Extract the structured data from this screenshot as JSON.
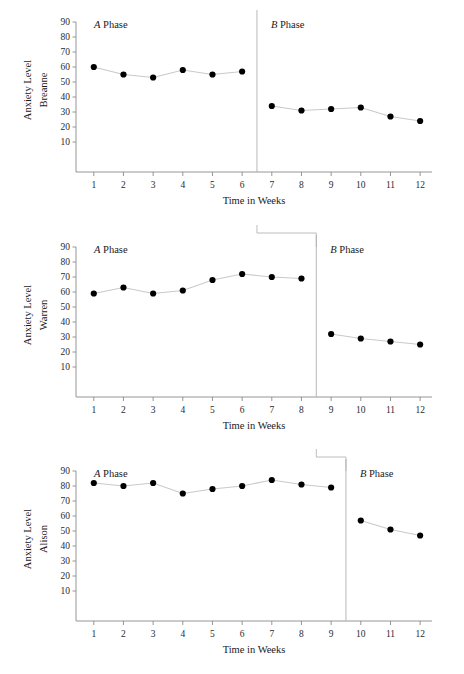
{
  "figure": {
    "type": "multiple-baseline-ab-design",
    "x_axis_title": "Time in Weeks",
    "y_axis_title": "Anxiety Level",
    "phase_a_letter": "A",
    "phase_a_word": "Phase",
    "phase_b_letter": "B",
    "phase_b_word": "Phase",
    "y_ticks": [
      90,
      80,
      70,
      60,
      50,
      40,
      30,
      20,
      10
    ],
    "x_ticks": [
      1,
      2,
      3,
      4,
      5,
      6,
      7,
      8,
      9,
      10,
      11,
      12
    ],
    "colors": {
      "marker": "#000000",
      "series_line": "#c9c9c9",
      "axis": "#8a8a8a",
      "phase_line": "#b0b0b0",
      "connector": "#b5b5b5",
      "background": "#ffffff"
    }
  },
  "chart_data": [
    {
      "type": "line",
      "title": "Breanne",
      "subject": "Breanne",
      "xlabel": "Time in Weeks",
      "ylabel": "Anxiety Level",
      "ylim": [
        0,
        95
      ],
      "xlim": [
        0.4,
        12.4
      ],
      "grid": false,
      "legend": "none",
      "phase_change_x": 6.5,
      "x": [
        1,
        2,
        3,
        4,
        5,
        6,
        7,
        8,
        9,
        10,
        11,
        12
      ],
      "values": [
        60,
        55,
        53,
        58,
        55,
        57,
        34,
        31,
        32,
        33,
        27,
        24
      ],
      "series": [
        {
          "name": "A Phase",
          "x": [
            1,
            2,
            3,
            4,
            5,
            6
          ],
          "values": [
            60,
            55,
            53,
            58,
            55,
            57
          ]
        },
        {
          "name": "B Phase",
          "x": [
            7,
            8,
            9,
            10,
            11,
            12
          ],
          "values": [
            34,
            31,
            32,
            33,
            27,
            24
          ]
        }
      ]
    },
    {
      "type": "line",
      "title": "Warren",
      "subject": "Warren",
      "xlabel": "Time in Weeks",
      "ylabel": "Anxiety Level",
      "ylim": [
        0,
        95
      ],
      "xlim": [
        0.4,
        12.4
      ],
      "grid": false,
      "legend": "none",
      "phase_change_x": 8.5,
      "x": [
        1,
        2,
        3,
        4,
        5,
        6,
        7,
        8,
        9,
        10,
        11,
        12
      ],
      "values": [
        59,
        63,
        59,
        61,
        68,
        72,
        70,
        69,
        32,
        29,
        27,
        25
      ],
      "series": [
        {
          "name": "A Phase",
          "x": [
            1,
            2,
            3,
            4,
            5,
            6,
            7,
            8
          ],
          "values": [
            59,
            63,
            59,
            61,
            68,
            72,
            70,
            69
          ]
        },
        {
          "name": "B Phase",
          "x": [
            9,
            10,
            11,
            12
          ],
          "values": [
            32,
            29,
            27,
            25
          ]
        }
      ]
    },
    {
      "type": "line",
      "title": "Alison",
      "subject": "Alison",
      "xlabel": "Time in Weeks",
      "ylabel": "Anxiety Level",
      "ylim": [
        0,
        95
      ],
      "xlim": [
        0.4,
        12.4
      ],
      "grid": false,
      "legend": "none",
      "phase_change_x": 9.5,
      "x": [
        1,
        2,
        3,
        4,
        5,
        6,
        7,
        8,
        9,
        10,
        11,
        12
      ],
      "values": [
        82,
        80,
        82,
        75,
        78,
        80,
        84,
        81,
        79,
        57,
        51,
        47
      ],
      "series": [
        {
          "name": "A Phase",
          "x": [
            1,
            2,
            3,
            4,
            5,
            6,
            7,
            8,
            9
          ],
          "values": [
            82,
            80,
            82,
            75,
            78,
            80,
            84,
            81,
            79
          ]
        },
        {
          "name": "B Phase",
          "x": [
            10,
            11,
            12
          ],
          "values": [
            57,
            51,
            47
          ]
        }
      ]
    }
  ]
}
